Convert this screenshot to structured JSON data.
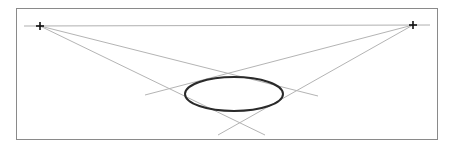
{
  "canvas": {
    "width": 454,
    "height": 150,
    "background": "#ffffff"
  },
  "frame": {
    "x": 16.5,
    "y": 8.5,
    "w": 421,
    "h": 131,
    "stroke": "#8a8a8a"
  },
  "horizon": {
    "x1": 24,
    "y1": 26,
    "x2": 430,
    "y2": 25,
    "stroke": "#b0b0b0"
  },
  "vanishing_points": [
    {
      "name": "vp-left",
      "x": 40,
      "y": 26
    },
    {
      "name": "vp-right",
      "x": 413,
      "y": 25
    }
  ],
  "construction_lines": [
    {
      "x1": 40,
      "y1": 26,
      "x2": 318,
      "y2": 96
    },
    {
      "x1": 40,
      "y1": 26,
      "x2": 265,
      "y2": 135
    },
    {
      "x1": 413,
      "y1": 25,
      "x2": 145,
      "y2": 95
    },
    {
      "x1": 413,
      "y1": 25,
      "x2": 218,
      "y2": 135
    }
  ],
  "line_color": "#b4b4b4",
  "ellipse": {
    "cx": 234,
    "cy": 94,
    "rx": 49,
    "ry": 17,
    "stroke": "#2a2a2a",
    "stroke_width": 2
  }
}
